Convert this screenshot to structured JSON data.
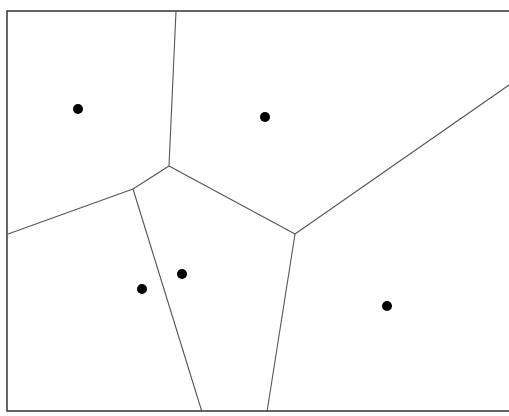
{
  "diagram": {
    "type": "voronoi",
    "border_color": "#333333",
    "edge_color": "#555555",
    "site_color": "#000000",
    "frame": {
      "x1": 7,
      "y1": 11,
      "x2": 509,
      "y2": 411
    },
    "sites": [
      {
        "id": "site-1",
        "x": 78,
        "y": 109
      },
      {
        "id": "site-2",
        "x": 265,
        "y": 117
      },
      {
        "id": "site-3",
        "x": 182,
        "y": 274
      },
      {
        "id": "site-4",
        "x": 142,
        "y": 289
      },
      {
        "id": "site-5",
        "x": 387,
        "y": 306
      }
    ],
    "edges": [
      {
        "x1": 176,
        "y1": 11,
        "x2": 169,
        "y2": 166
      },
      {
        "x1": 169,
        "y1": 166,
        "x2": 133,
        "y2": 189
      },
      {
        "x1": 133,
        "y1": 189,
        "x2": 8,
        "y2": 234
      },
      {
        "x1": 133,
        "y1": 189,
        "x2": 202,
        "y2": 412
      },
      {
        "x1": 169,
        "y1": 166,
        "x2": 295,
        "y2": 234
      },
      {
        "x1": 295,
        "y1": 234,
        "x2": 509,
        "y2": 85
      },
      {
        "x1": 295,
        "y1": 234,
        "x2": 267,
        "y2": 412
      }
    ]
  }
}
